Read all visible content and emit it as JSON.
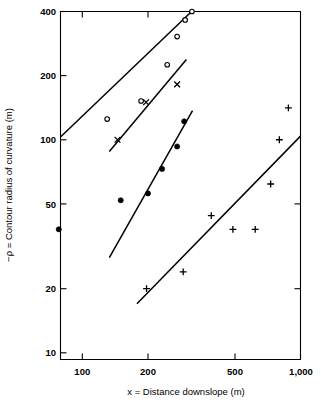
{
  "chart_data": {
    "type": "scatter",
    "title": "",
    "subtitle": "",
    "xlabel": "x = Distance downslope (m)",
    "ylabel": "−ρ = Contour radius of curvature (m)",
    "xscale": "log",
    "yscale": "log",
    "xlim": [
      70,
      1050
    ],
    "ylim": [
      10,
      400
    ],
    "grid": false,
    "legend_position": "none",
    "xticks": [
      100,
      200,
      500,
      1000
    ],
    "xtick_labels": [
      "100",
      "200",
      "500",
      "1,000"
    ],
    "yticks": [
      10,
      20,
      50,
      100,
      200,
      400
    ],
    "ytick_labels": [
      "10",
      "20",
      "50",
      "100",
      "200",
      "400"
    ],
    "series": [
      {
        "name": "series-open-circles",
        "marker": "open-circle",
        "points": [
          {
            "x": 130,
            "y": 125
          },
          {
            "x": 186,
            "y": 152
          },
          {
            "x": 245,
            "y": 225
          },
          {
            "x": 272,
            "y": 305
          },
          {
            "x": 296,
            "y": 365
          },
          {
            "x": 318,
            "y": 400
          }
        ],
        "fit_line": {
          "x1": 77,
          "y1": 100,
          "x2": 325,
          "y2": 410
        }
      },
      {
        "name": "series-crosses",
        "marker": "cross",
        "points": [
          {
            "x": 145,
            "y": 100
          },
          {
            "x": 196,
            "y": 150
          },
          {
            "x": 272,
            "y": 182
          }
        ],
        "fit_line": {
          "x1": 133,
          "y1": 88,
          "x2": 300,
          "y2": 238
        }
      },
      {
        "name": "series-filled-circles",
        "marker": "filled-circle",
        "points": [
          {
            "x": 78,
            "y": 38
          },
          {
            "x": 150,
            "y": 52
          },
          {
            "x": 200,
            "y": 56
          },
          {
            "x": 232,
            "y": 73
          },
          {
            "x": 272,
            "y": 93
          },
          {
            "x": 293,
            "y": 122
          }
        ],
        "fit_line": {
          "x1": 133,
          "y1": 28,
          "x2": 320,
          "y2": 137
        }
      },
      {
        "name": "series-plus",
        "marker": "plus",
        "points": [
          {
            "x": 197,
            "y": 20
          },
          {
            "x": 290,
            "y": 24
          },
          {
            "x": 390,
            "y": 44
          },
          {
            "x": 490,
            "y": 38
          },
          {
            "x": 620,
            "y": 38
          },
          {
            "x": 730,
            "y": 62
          },
          {
            "x": 800,
            "y": 100
          },
          {
            "x": 880,
            "y": 141
          }
        ],
        "fit_line": {
          "x1": 178,
          "y1": 17,
          "x2": 1000,
          "y2": 104
        }
      }
    ],
    "annotations": []
  }
}
